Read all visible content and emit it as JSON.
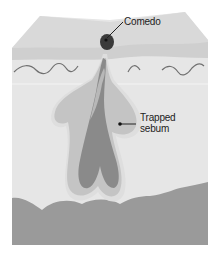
{
  "diagram": {
    "labels": {
      "comedo": "Comedo",
      "trapped_sebum_line1": "Trapped",
      "trapped_sebum_line2": "sebum"
    },
    "colors": {
      "background": "#ffffff",
      "epidermis_top": "#d9d9d9",
      "epidermis_band": "#cfcfcf",
      "dermis": "#e6e6e6",
      "subcutis": "#9a9a9a",
      "gland_outer": "#c4c4c4",
      "gland_inner": "#a9a9a9",
      "follicle_core": "#8a8a8a",
      "comedo_plug": "#3a3a3a",
      "leader_line": "#222222"
    }
  }
}
